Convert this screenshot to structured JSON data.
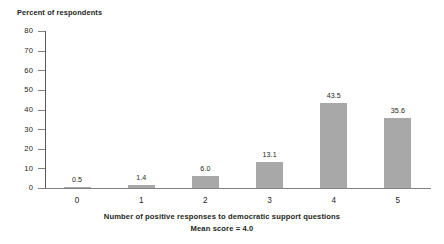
{
  "chart_data": {
    "type": "bar",
    "title": "",
    "categories": [
      "0",
      "1",
      "2",
      "3",
      "4",
      "5"
    ],
    "values": [
      0.5,
      1.4,
      6.0,
      13.1,
      43.5,
      35.6
    ],
    "value_labels": [
      "0.5",
      "1.4",
      "6.0",
      "13.1",
      "43.5",
      "35.6"
    ],
    "ylabel": "Percent of respondents",
    "xlabel": "Number of positive responses to democratic support questions",
    "annotation": "Mean score = 4.0",
    "ylim": [
      0,
      80
    ],
    "ytick_values": [
      0,
      10,
      20,
      30,
      40,
      50,
      60,
      70,
      80
    ],
    "ytick_labels": [
      "0",
      "10",
      "20",
      "30",
      "40",
      "50",
      "60",
      "70",
      "80"
    ],
    "grid": false,
    "legend": null,
    "series_color": "#a8a8a8",
    "axis_color": "#808285",
    "text_color": "#231f20",
    "background": "#ffffff"
  }
}
